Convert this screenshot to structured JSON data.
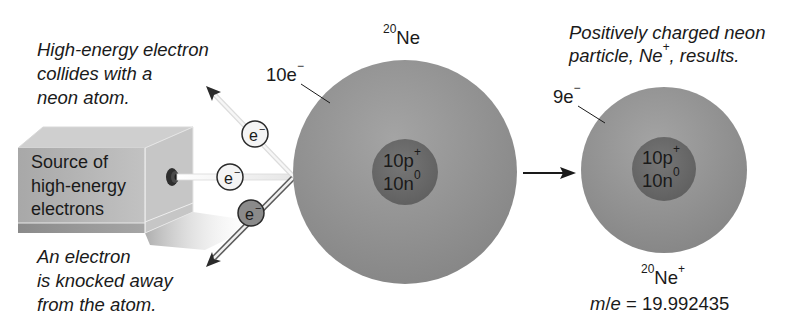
{
  "captions": {
    "collision": [
      "High-energy electron",
      "collides with a",
      "neon atom."
    ],
    "knocked": [
      "An electron",
      "is knocked away",
      "from the atom."
    ],
    "result": [
      "Positively charged neon",
      "particle, Ne",
      "+",
      ", results."
    ]
  },
  "source_box": {
    "label": [
      "Source of",
      "high-energy",
      "electrons"
    ]
  },
  "electrons": [
    {
      "label": "e",
      "charge": "−",
      "role": "incoming-scattered"
    },
    {
      "label": "e",
      "charge": "−",
      "role": "incoming-beam"
    },
    {
      "label": "e",
      "charge": "−",
      "role": "ejected"
    }
  ],
  "neutral_atom": {
    "mass_number": "20",
    "symbol": "Ne",
    "electron_count_label": "10e",
    "electron_charge": "−",
    "nucleus": {
      "protons": "10p",
      "proton_charge": "+",
      "neutrons": "10n",
      "neutron_charge": "0"
    }
  },
  "ion": {
    "mass_number": "20",
    "symbol": "Ne",
    "charge": "+",
    "electron_count_label": "9e",
    "electron_charge": "−",
    "nucleus": {
      "protons": "10p",
      "proton_charge": "+",
      "neutrons": "10n",
      "neutron_charge": "0"
    },
    "mass_to_charge": {
      "label_m": "m",
      "slash": "/",
      "label_e": "e",
      "equals": " = ",
      "value": "19.992435"
    }
  },
  "colors": {
    "electron_cloud": "#8e8e8e",
    "nucleus": "#6e6e6e",
    "ejected_electron": "#8a8a8a",
    "box_front": "#b4b4b4",
    "box_top": "#cfcfcf",
    "box_side": "#c4c4c4",
    "text": "#1a1a1a"
  }
}
